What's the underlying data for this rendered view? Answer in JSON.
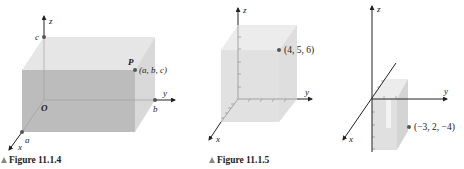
{
  "figures": [
    {
      "id": "fig1",
      "caption": "Figure 11.1.4",
      "axis_labels": {
        "x": "x",
        "y": "y",
        "z": "z"
      },
      "origin_label": "O",
      "intercept_labels": {
        "a": "a",
        "b": "b",
        "c": "c"
      },
      "point_name": "P",
      "point_label": "(a, b, c)"
    },
    {
      "id": "fig2",
      "caption": "Figure 11.1.5",
      "axis_labels": {
        "x": "x",
        "y": "y",
        "z": "z"
      },
      "point_label": "(4, 5, 6)"
    },
    {
      "id": "fig3",
      "axis_labels": {
        "x": "x",
        "y": "y",
        "z": "z"
      },
      "point_label": "(−3, 2, −4)"
    }
  ],
  "colors": {
    "box_front": "#bdbdbd",
    "box_top": "#e3e3e3",
    "box_side": "#d6d6d6",
    "axis": "#333333",
    "dot": "#555555",
    "caption_triangle": "#8a8a8a"
  }
}
